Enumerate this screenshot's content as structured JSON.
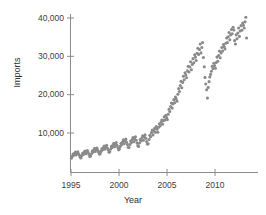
{
  "chart_data": {
    "type": "scatter",
    "title": "",
    "xlabel": "Year",
    "ylabel": "Imports",
    "xlim": [
      1994.4,
      1994.4
    ],
    "ylim": [
      0,
      0
    ],
    "grid": false,
    "legend": null,
    "point_color": "#8a8a8a",
    "axis_color": "#8c8c8c",
    "xticks": [
      1995,
      2000,
      2005,
      2010
    ],
    "xtick_labels": [
      "1995",
      "2000",
      "2005",
      "2010"
    ],
    "yticks": [
      10000,
      20000,
      30000,
      40000
    ],
    "ytick_labels": [
      "10,000",
      "20,000",
      "30,000",
      "40,000"
    ],
    "x": [
      1995.04,
      1995.13,
      1995.21,
      1995.29,
      1995.38,
      1995.46,
      1995.54,
      1995.63,
      1995.71,
      1995.79,
      1995.88,
      1995.96,
      1996.04,
      1996.13,
      1996.21,
      1996.29,
      1996.38,
      1996.46,
      1996.54,
      1996.63,
      1996.71,
      1996.79,
      1996.88,
      1996.96,
      1997.04,
      1997.13,
      1997.21,
      1997.29,
      1997.38,
      1997.46,
      1997.54,
      1997.63,
      1997.71,
      1997.79,
      1997.88,
      1997.96,
      1998.04,
      1998.13,
      1998.21,
      1998.29,
      1998.38,
      1998.46,
      1998.54,
      1998.63,
      1998.71,
      1998.79,
      1998.88,
      1998.96,
      1999.04,
      1999.13,
      1999.21,
      1999.29,
      1999.38,
      1999.46,
      1999.54,
      1999.63,
      1999.71,
      1999.79,
      1999.88,
      1999.96,
      2000.04,
      2000.13,
      2000.21,
      2000.29,
      2000.38,
      2000.46,
      2000.54,
      2000.63,
      2000.71,
      2000.79,
      2000.88,
      2000.96,
      2001.04,
      2001.13,
      2001.21,
      2001.29,
      2001.38,
      2001.46,
      2001.54,
      2001.63,
      2001.71,
      2001.79,
      2001.88,
      2001.96,
      2002.04,
      2002.13,
      2002.21,
      2002.29,
      2002.38,
      2002.46,
      2002.54,
      2002.63,
      2002.71,
      2002.79,
      2002.88,
      2002.96,
      2003.04,
      2003.13,
      2003.21,
      2003.29,
      2003.38,
      2003.46,
      2003.54,
      2003.63,
      2003.71,
      2003.79,
      2003.88,
      2003.96,
      2004.04,
      2004.13,
      2004.21,
      2004.29,
      2004.38,
      2004.46,
      2004.54,
      2004.63,
      2004.71,
      2004.79,
      2004.88,
      2004.96,
      2005.04,
      2005.13,
      2005.21,
      2005.29,
      2005.38,
      2005.46,
      2005.54,
      2005.63,
      2005.71,
      2005.79,
      2005.88,
      2005.96,
      2006.04,
      2006.13,
      2006.21,
      2006.29,
      2006.38,
      2006.46,
      2006.54,
      2006.63,
      2006.71,
      2006.79,
      2006.88,
      2006.96,
      2007.04,
      2007.13,
      2007.21,
      2007.29,
      2007.38,
      2007.46,
      2007.54,
      2007.63,
      2007.71,
      2007.79,
      2007.88,
      2007.96,
      2008.04,
      2008.13,
      2008.21,
      2008.29,
      2008.38,
      2008.46,
      2008.54,
      2008.63,
      2008.71,
      2008.79,
      2008.88,
      2008.96,
      2009.04,
      2009.13,
      2009.21,
      2009.29,
      2009.38,
      2009.46,
      2009.54,
      2009.63,
      2009.71,
      2009.79,
      2009.88,
      2009.96,
      2010.04,
      2010.13,
      2010.21,
      2010.29,
      2010.38,
      2010.46,
      2010.54,
      2010.63,
      2010.71,
      2010.79,
      2010.88,
      2010.96,
      2011.04,
      2011.13,
      2011.21,
      2011.29,
      2011.38,
      2011.46,
      2011.54,
      2011.63,
      2011.71,
      2011.79,
      2011.88,
      2011.96,
      2012.04,
      2012.13,
      2012.21,
      2012.29,
      2012.38,
      2012.46,
      2012.54,
      2012.63,
      2012.71,
      2012.79,
      2012.88,
      2012.96,
      2013.04,
      2013.13,
      2013.21,
      2013.29
    ],
    "y": [
      3400,
      3900,
      4500,
      4200,
      4700,
      5000,
      4300,
      4800,
      5100,
      4600,
      4200,
      3700,
      3500,
      4100,
      4700,
      4400,
      5000,
      5300,
      4600,
      5100,
      5400,
      4900,
      4400,
      3900,
      4000,
      4600,
      5300,
      5000,
      5600,
      6000,
      5200,
      5700,
      6100,
      5500,
      5000,
      4500,
      4600,
      5200,
      5900,
      5600,
      6200,
      6600,
      5800,
      6400,
      6800,
      6100,
      5600,
      5000,
      5100,
      5800,
      6500,
      6200,
      6900,
      7300,
      6400,
      7000,
      7500,
      6800,
      6200,
      5600,
      5800,
      6500,
      7300,
      7000,
      7700,
      8200,
      7200,
      7900,
      8400,
      7600,
      7000,
      6300,
      6200,
      7000,
      7900,
      7500,
      8300,
      8800,
      7700,
      8500,
      9000,
      8100,
      7400,
      6700,
      6500,
      7400,
      8300,
      7900,
      8700,
      9300,
      8100,
      9000,
      9500,
      8600,
      7800,
      7100,
      7200,
      8300,
      9400,
      9000,
      10100,
      10800,
      9500,
      10500,
      11200,
      10200,
      11700,
      11000,
      10200,
      11500,
      12400,
      11900,
      12800,
      13400,
      12300,
      13200,
      14200,
      13400,
      14600,
      14000,
      13500,
      14900,
      16200,
      15600,
      16900,
      17800,
      16500,
      17600,
      18700,
      17900,
      19400,
      18900,
      18300,
      20100,
      21600,
      20800,
      22400,
      23500,
      21800,
      23200,
      24800,
      23900,
      25700,
      25100,
      24400,
      26200,
      27400,
      25900,
      27200,
      28600,
      26500,
      27900,
      29400,
      28300,
      30400,
      29800,
      28900,
      30800,
      32100,
      30500,
      31800,
      33200,
      30900,
      32300,
      33600,
      29700,
      27300,
      24500,
      22800,
      21300,
      19100,
      21900,
      23400,
      24600,
      25300,
      26100,
      27400,
      26800,
      28200,
      27600,
      26900,
      28400,
      29800,
      28700,
      30200,
      31400,
      29600,
      30900,
      32300,
      31400,
      33100,
      32500,
      31900,
      33400,
      34800,
      33600,
      35100,
      36200,
      34300,
      35600,
      37000,
      35900,
      37600,
      36900,
      34100,
      33200,
      35600,
      34600,
      36100,
      37400,
      35200,
      36600,
      38000,
      36800,
      38700,
      38100,
      37400,
      39000,
      40200,
      34800
    ]
  },
  "axes": {
    "xlabel": "Year",
    "ylabel": "Imports"
  }
}
